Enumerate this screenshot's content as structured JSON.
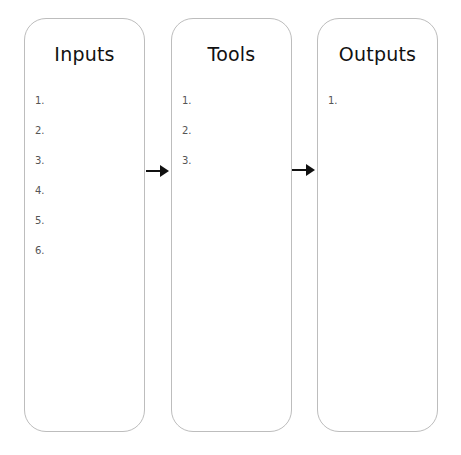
{
  "columns": [
    {
      "title": "Inputs",
      "items": [
        "1.",
        "2.",
        "3.",
        "4.",
        "5.",
        "6."
      ]
    },
    {
      "title": "Tools",
      "items": [
        "1.",
        "2.",
        "3."
      ]
    },
    {
      "title": "Outputs",
      "items": [
        "1."
      ]
    }
  ],
  "arrows": [
    {
      "from": "Inputs",
      "to": "Tools"
    },
    {
      "from": "Tools",
      "to": "Outputs"
    }
  ]
}
